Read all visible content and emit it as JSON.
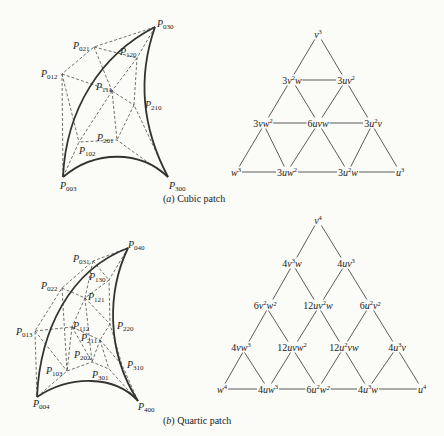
{
  "figure": {
    "cubic": {
      "caption_tag": "a",
      "caption_text": "Cubic patch",
      "control_points": [
        {
          "name": "P",
          "sub": "030",
          "x": 157,
          "y": 19
        },
        {
          "name": "P",
          "sub": "021",
          "x": 73,
          "y": 41
        },
        {
          "name": "P",
          "sub": "120",
          "x": 120,
          "y": 47
        },
        {
          "name": "P",
          "sub": "012",
          "x": 41,
          "y": 69
        },
        {
          "name": "P",
          "sub": "111",
          "x": 96,
          "y": 82
        },
        {
          "name": "P",
          "sub": "210",
          "x": 145,
          "y": 100
        },
        {
          "name": "P",
          "sub": "201",
          "x": 97,
          "y": 133
        },
        {
          "name": "P",
          "sub": "102",
          "x": 79,
          "y": 146
        },
        {
          "name": "P",
          "sub": "003",
          "x": 60,
          "y": 181
        },
        {
          "name": "P",
          "sub": "300",
          "x": 169,
          "y": 181
        }
      ],
      "bernstein_terms": [
        {
          "coef": "",
          "expr": "v",
          "pow": "3",
          "tail": "",
          "x": 318,
          "y": 34
        },
        {
          "coef": "3",
          "expr": "v",
          "pow": "2",
          "tail": "w",
          "x": 292,
          "y": 80
        },
        {
          "coef": "3",
          "expr": "uv",
          "pow": "2",
          "tail": "",
          "x": 346,
          "y": 80
        },
        {
          "coef": "3",
          "expr": "vw",
          "pow": "2",
          "tail": "",
          "x": 263,
          "y": 123
        },
        {
          "coef": "6",
          "expr": "uvw",
          "pow": "",
          "tail": "",
          "x": 318,
          "y": 123
        },
        {
          "coef": "3",
          "expr": "u",
          "pow": "2",
          "tail": "v",
          "x": 373,
          "y": 123
        },
        {
          "coef": "",
          "expr": "w",
          "pow": "3",
          "tail": "",
          "x": 236,
          "y": 172
        },
        {
          "coef": "3",
          "expr": "uw",
          "pow": "2",
          "tail": "",
          "x": 287,
          "y": 172
        },
        {
          "coef": "3",
          "expr": "u",
          "pow": "2",
          "tail": "w",
          "x": 348,
          "y": 172
        },
        {
          "coef": "",
          "expr": "u",
          "pow": "3",
          "tail": "",
          "x": 400,
          "y": 172
        }
      ]
    },
    "quartic": {
      "caption_tag": "b",
      "caption_text": "Quartic patch",
      "control_points": [
        {
          "name": "P",
          "sub": "040",
          "x": 128,
          "y": 240
        },
        {
          "name": "P",
          "sub": "031",
          "x": 73,
          "y": 254
        },
        {
          "name": "P",
          "sub": "130",
          "x": 89,
          "y": 272
        },
        {
          "name": "P",
          "sub": "022",
          "x": 41,
          "y": 281
        },
        {
          "name": "P",
          "sub": "121",
          "x": 88,
          "y": 292
        },
        {
          "name": "P",
          "sub": "013",
          "x": 16,
          "y": 327
        },
        {
          "name": "P",
          "sub": "112",
          "x": 73,
          "y": 321
        },
        {
          "name": "P",
          "sub": "220",
          "x": 117,
          "y": 321
        },
        {
          "name": "P",
          "sub": "211",
          "x": 81,
          "y": 333
        },
        {
          "name": "P",
          "sub": "202",
          "x": 74,
          "y": 350
        },
        {
          "name": "P",
          "sub": "310",
          "x": 127,
          "y": 360
        },
        {
          "name": "P",
          "sub": "103",
          "x": 46,
          "y": 366
        },
        {
          "name": "P",
          "sub": "301",
          "x": 92,
          "y": 370
        },
        {
          "name": "P",
          "sub": "004",
          "x": 33,
          "y": 399
        },
        {
          "name": "P",
          "sub": "400",
          "x": 138,
          "y": 402
        }
      ],
      "bernstein_terms": [
        {
          "coef": "",
          "expr": "v",
          "pow": "4",
          "tail": "",
          "x": 318,
          "y": 220
        },
        {
          "coef": "4",
          "expr": "v",
          "pow": "3",
          "tail": "w",
          "x": 292,
          "y": 263
        },
        {
          "coef": "4",
          "expr": "uv",
          "pow": "3",
          "tail": "",
          "x": 346,
          "y": 263
        },
        {
          "coef": "6",
          "expr": "v",
          "pow": "2",
          "tail": "w²",
          "x": 265,
          "y": 305
        },
        {
          "coef": "12",
          "expr": "uv",
          "pow": "2",
          "tail": "w",
          "x": 318,
          "y": 305
        },
        {
          "coef": "6",
          "expr": "u",
          "pow": "2",
          "tail": "v²",
          "x": 370,
          "y": 305
        },
        {
          "coef": "4",
          "expr": "vw",
          "pow": "3",
          "tail": "",
          "x": 241,
          "y": 347
        },
        {
          "coef": "12",
          "expr": "uvw",
          "pow": "2",
          "tail": "",
          "x": 292,
          "y": 347
        },
        {
          "coef": "12",
          "expr": "u",
          "pow": "2",
          "tail": "vw",
          "x": 344,
          "y": 347
        },
        {
          "coef": "4",
          "expr": "u",
          "pow": "3",
          "tail": "v",
          "x": 397,
          "y": 347
        },
        {
          "coef": "",
          "expr": "w",
          "pow": "4",
          "tail": "",
          "x": 222,
          "y": 389
        },
        {
          "coef": "4",
          "expr": "uw",
          "pow": "3",
          "tail": "",
          "x": 268,
          "y": 389
        },
        {
          "coef": "6",
          "expr": "u",
          "pow": "2",
          "tail": "w²",
          "x": 318,
          "y": 389
        },
        {
          "coef": "4",
          "expr": "u",
          "pow": "3",
          "tail": "w",
          "x": 368,
          "y": 389
        },
        {
          "coef": "",
          "expr": "u",
          "pow": "4",
          "tail": "",
          "x": 422,
          "y": 389
        }
      ]
    }
  }
}
